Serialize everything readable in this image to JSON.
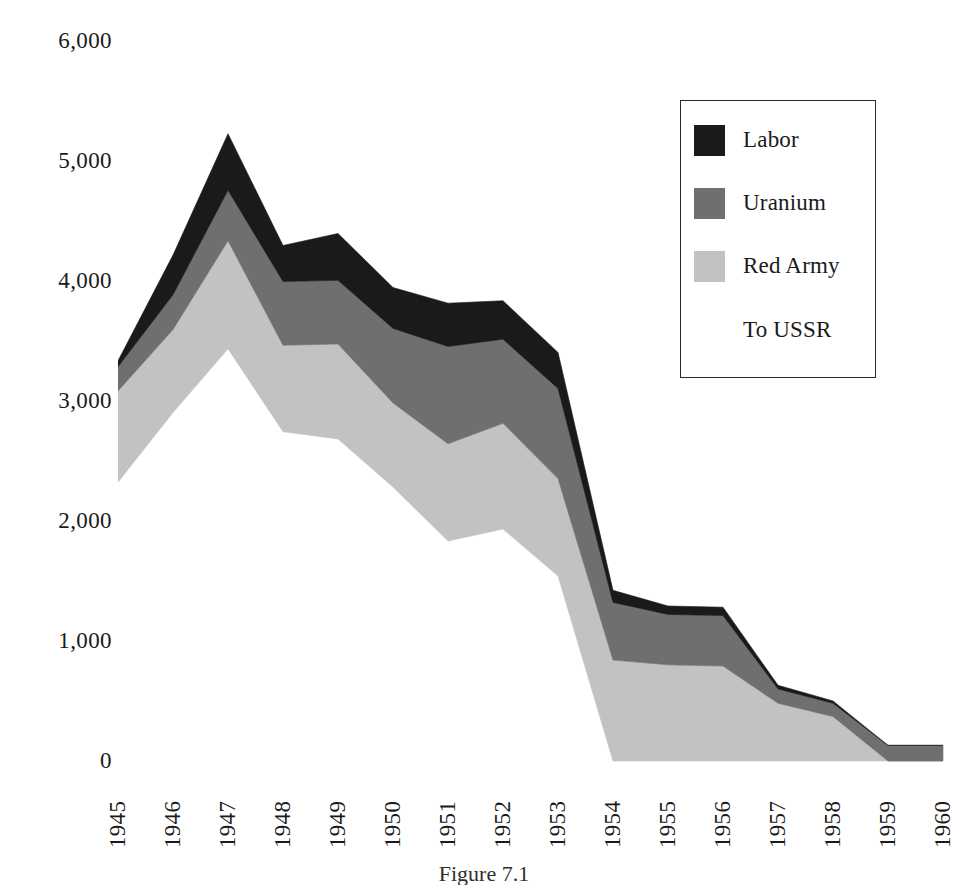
{
  "figure": {
    "caption": "Figure 7.1"
  },
  "legend": {
    "position": "top-right",
    "entries": [
      {
        "label": "Labor",
        "color": "#1a1a1a",
        "has_swatch": true
      },
      {
        "label": "Uranium",
        "color": "#6f6f6f",
        "has_swatch": true
      },
      {
        "label": "Red Army",
        "color": "#c2c2c2",
        "has_swatch": true
      },
      {
        "label": "To USSR",
        "color": "#ffffff",
        "has_swatch": false
      }
    ]
  },
  "axes": {
    "y_ticks": [
      "6,000",
      "5,000",
      "4,000",
      "3,000",
      "2,000",
      "1,000",
      "0"
    ],
    "x_ticks": [
      "1945",
      "1946",
      "1947",
      "1948",
      "1949",
      "1950",
      "1951",
      "1952",
      "1953",
      "1954",
      "1955",
      "1956",
      "1957",
      "1958",
      "1959",
      "1960"
    ]
  },
  "chart_data": {
    "type": "area",
    "stacked": true,
    "title": "",
    "xlabel": "",
    "ylabel": "",
    "ylim": [
      0,
      6000
    ],
    "ytick_step": 1000,
    "grid": false,
    "legend_position": "top-right",
    "categories": [
      "1945",
      "1946",
      "1947",
      "1948",
      "1949",
      "1950",
      "1951",
      "1952",
      "1953",
      "1954",
      "1955",
      "1956",
      "1957",
      "1958",
      "1959",
      "1960"
    ],
    "series": [
      {
        "name": "To USSR",
        "color": "#ffffff",
        "values": [
          2320,
          2900,
          3430,
          2740,
          2680,
          2280,
          1830,
          1930,
          1540,
          0,
          0,
          0,
          0,
          0,
          0,
          0
        ]
      },
      {
        "name": "Red Army",
        "color": "#c2c2c2",
        "values": [
          760,
          690,
          900,
          720,
          790,
          700,
          810,
          880,
          810,
          840,
          800,
          790,
          480,
          370,
          0,
          0
        ]
      },
      {
        "name": "Uranium",
        "color": "#6f6f6f",
        "values": [
          200,
          290,
          420,
          530,
          530,
          620,
          810,
          700,
          750,
          480,
          420,
          420,
          120,
          110,
          130,
          130
        ]
      },
      {
        "name": "Labor",
        "color": "#1a1a1a",
        "values": [
          50,
          330,
          470,
          300,
          390,
          340,
          360,
          320,
          300,
          100,
          70,
          70,
          30,
          20,
          0,
          0
        ]
      }
    ],
    "totals": [
      3330,
      4210,
      5220,
      4290,
      4390,
      3940,
      3810,
      3830,
      3400,
      1420,
      1290,
      1280,
      630,
      500,
      130,
      130
    ]
  }
}
